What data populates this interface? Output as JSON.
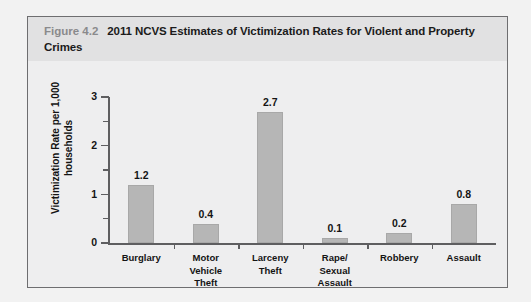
{
  "figure": {
    "number": "Figure 4.2",
    "title": "2011 NCVS Estimates of Victimization Rates for Violent and Property Crimes"
  },
  "colors": {
    "card_border": "#6e6e70",
    "header_bg": "#e1e1e2",
    "body_bg": "#eeeeef",
    "bar_fill": "#b6b6b6",
    "axis": "#5e5e60",
    "text": "#141414",
    "figure_number": "#8a8a8c"
  },
  "chart_data": {
    "type": "bar",
    "title": "2011 NCVS Estimates of Victimization Rates for Violent and Property Crimes",
    "xlabel": "",
    "ylabel": "Victimization Rate per 1,000 households",
    "categories": [
      "Burglary",
      "Motor Vehicle Theft",
      "Larceny Theft",
      "Rape/ Sexual Assault",
      "Robbery",
      "Assault"
    ],
    "category_lines": [
      [
        "Burglary"
      ],
      [
        "Motor",
        "Vehicle",
        "Theft"
      ],
      [
        "Larceny",
        "Theft"
      ],
      [
        "Rape/",
        "Sexual",
        "Assault"
      ],
      [
        "Robbery"
      ],
      [
        "Assault"
      ]
    ],
    "values": [
      1.2,
      0.4,
      2.7,
      0.1,
      0.2,
      0.8
    ],
    "value_labels": [
      "1.2",
      "0.4",
      "2.7",
      "0.1",
      "0.2",
      "0.8"
    ],
    "ylim": [
      0,
      3
    ],
    "ytick_major": [
      0,
      1,
      2,
      3
    ],
    "ytick_major_labels": [
      "0",
      "1",
      "2",
      "3"
    ],
    "ytick_minor": [
      0.5,
      1.5,
      2.5
    ],
    "grid": false,
    "legend": false
  }
}
